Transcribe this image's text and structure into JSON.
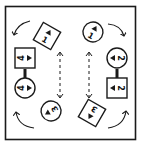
{
  "diagram": {
    "type": "rotation-puzzle",
    "stroke_color": "#1a1a1a",
    "background": "#ffffff",
    "frame": {
      "x": 5,
      "y": 6,
      "width": 131,
      "height": 134
    },
    "pieces": [
      {
        "id": "square-1",
        "shape": "square",
        "label": "1",
        "cx": 47,
        "cy": 36,
        "rotation": 30
      },
      {
        "id": "circle-1",
        "shape": "circle",
        "label": "1",
        "cx": 93,
        "cy": 32,
        "rotation": 30
      },
      {
        "id": "circle-2",
        "shape": "circle",
        "label": "2",
        "cx": 117,
        "cy": 58,
        "rotation": 90
      },
      {
        "id": "square-2",
        "shape": "square",
        "label": "2",
        "cx": 117,
        "cy": 88,
        "rotation": 90
      },
      {
        "id": "square-3",
        "shape": "square",
        "label": "3",
        "cx": 92,
        "cy": 113,
        "rotation": -150
      },
      {
        "id": "circle-3",
        "shape": "circle",
        "label": "3",
        "cx": 51,
        "cy": 111,
        "rotation": -120
      },
      {
        "id": "circle-4",
        "shape": "circle",
        "label": "4",
        "cx": 25,
        "cy": 88,
        "rotation": -90
      },
      {
        "id": "square-4",
        "shape": "square",
        "label": "4",
        "cx": 25,
        "cy": 58,
        "rotation": -90
      }
    ],
    "connectors": [
      {
        "from": "square-4",
        "to": "circle-4"
      },
      {
        "from": "circle-2",
        "to": "square-2"
      }
    ],
    "dashed_arrows": [
      {
        "x": 60,
        "y1": 52,
        "y2": 98,
        "direction": "both"
      },
      {
        "x": 89,
        "y1": 52,
        "y2": 98,
        "direction": "both"
      }
    ],
    "curved_arrows": [
      {
        "corner": "top-left",
        "direction": "counterclockwise"
      },
      {
        "corner": "top-right",
        "direction": "clockwise"
      },
      {
        "corner": "bottom-left",
        "direction": "clockwise"
      },
      {
        "corner": "bottom-right",
        "direction": "counterclockwise"
      }
    ]
  }
}
